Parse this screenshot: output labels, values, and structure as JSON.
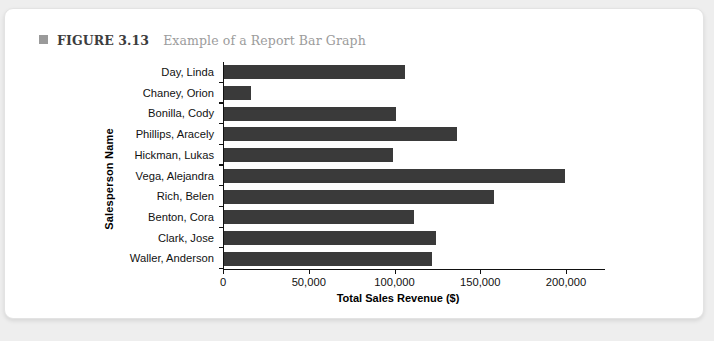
{
  "caption": {
    "bullet": "square-bullet",
    "label": "FIGURE 3.13",
    "title": "Example of a Report Bar Graph"
  },
  "colors": {
    "bar": "#3a3a3a",
    "axis": "#111111",
    "card_background": "#ffffff",
    "page_background": "#eeeeee",
    "caption_label": "#3d3d3d",
    "caption_title": "#9c9c9c",
    "bullet": "#9a9a9a"
  },
  "chart_data": {
    "type": "bar",
    "orientation": "horizontal",
    "title": "",
    "xlabel": "Total Sales Revenue ($)",
    "ylabel": "Salesperson Name",
    "xlim": [
      0,
      215000
    ],
    "xticks": [
      0,
      50000,
      100000,
      150000,
      200000
    ],
    "xtick_labels": [
      "0",
      "50,000",
      "100,000",
      "150,000",
      "200,000"
    ],
    "grid": false,
    "legend": null,
    "categories": [
      "Day, Linda",
      "Chaney, Orion",
      "Bonilla, Cody",
      "Phillips, Aracely",
      "Hickman, Lukas",
      "Vega, Alejandra",
      "Rich, Belen",
      "Benton, Cora",
      "Clark, Jose",
      "Waller, Anderson"
    ],
    "values": [
      105500,
      15700,
      100300,
      135900,
      98500,
      198800,
      157400,
      110800,
      123600,
      121300
    ]
  }
}
